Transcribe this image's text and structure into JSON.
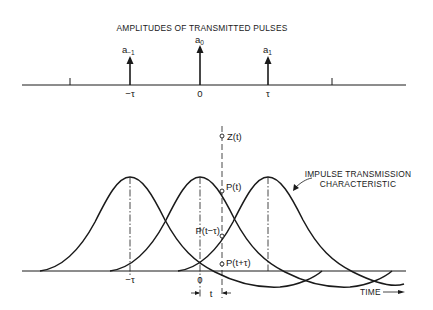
{
  "top_panel": {
    "title": "AMPLITUDES OF TRANSMITTED PULSES",
    "pulses": [
      {
        "label_base": "a",
        "label_sub": "−1",
        "tick": "−τ"
      },
      {
        "label_base": "a",
        "label_sub": "0",
        "tick": "0"
      },
      {
        "label_base": "a",
        "label_sub": "1",
        "tick": "τ"
      }
    ]
  },
  "bottom_panel": {
    "sample_label": "Z(t)",
    "points": {
      "p_t": "P(t)",
      "p_t_minus_tau": "P(t−τ)",
      "p_t_plus_tau": "P(t+τ)"
    },
    "ticks": {
      "minus_tau": "−τ",
      "zero": "0"
    },
    "offset_label": "t",
    "curve_label_line1": "IMPULSE TRANSMISSION",
    "curve_label_line2": "CHARACTERISTIC",
    "axis_label": "TIME"
  }
}
